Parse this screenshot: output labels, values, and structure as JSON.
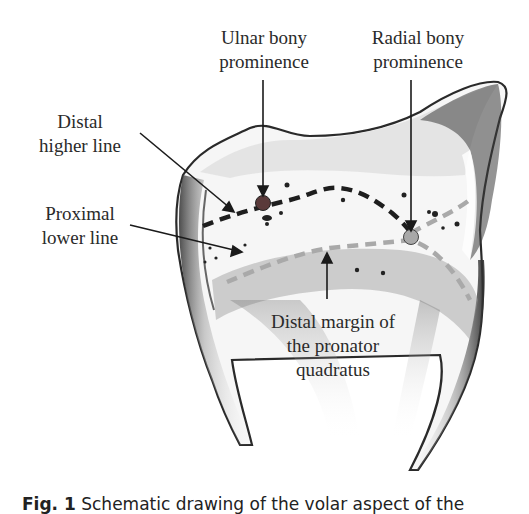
{
  "figure": {
    "labels": {
      "ulnar_prominence": [
        "Ulnar bony",
        "prominence"
      ],
      "radial_prominence": [
        "Radial bony",
        "prominence"
      ],
      "distal_line": [
        "Distal",
        "higher line"
      ],
      "proximal_line": [
        "Proximal",
        "lower line"
      ],
      "pronator": [
        "Distal margin of",
        "the pronator",
        "quadratus"
      ]
    },
    "markers": {
      "ulnar_dot_color": "#5a3a3a",
      "radial_dot_color": "#a8a8a8"
    },
    "lines": {
      "distal_line_color": "#1e1e1e",
      "proximal_line_color": "#a9a9a9"
    },
    "caption": {
      "fig_number": "Fig. 1",
      "text": "Schematic drawing of the volar aspect of the"
    }
  }
}
